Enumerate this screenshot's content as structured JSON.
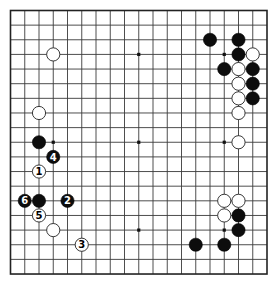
{
  "board": {
    "size": 19,
    "origin_x": 10.5,
    "origin_y": 10.5,
    "step_x": 14.25,
    "step_y": 14.64,
    "stone_radius": 6.6,
    "colors": {
      "background": "#ffffff",
      "line": "#3a3a3a",
      "black_stone": "#0d0d0d",
      "white_stone": "#ffffff"
    },
    "star_points": [
      [
        3,
        3
      ],
      [
        9,
        3
      ],
      [
        15,
        3
      ],
      [
        3,
        9
      ],
      [
        9,
        9
      ],
      [
        15,
        9
      ],
      [
        3,
        15
      ],
      [
        9,
        15
      ],
      [
        15,
        15
      ]
    ]
  },
  "stones": [
    {
      "col": 3,
      "row": 3,
      "color": "white",
      "label": ""
    },
    {
      "col": 2,
      "row": 7,
      "color": "white",
      "label": ""
    },
    {
      "col": 2,
      "row": 9,
      "color": "black",
      "label": ""
    },
    {
      "col": 2,
      "row": 13,
      "color": "black",
      "label": ""
    },
    {
      "col": 3,
      "row": 15,
      "color": "white",
      "label": ""
    },
    {
      "col": 14,
      "row": 2,
      "color": "black",
      "label": ""
    },
    {
      "col": 16,
      "row": 2,
      "color": "black",
      "label": ""
    },
    {
      "col": 16,
      "row": 3,
      "color": "black",
      "label": ""
    },
    {
      "col": 17,
      "row": 3,
      "color": "white",
      "label": ""
    },
    {
      "col": 15,
      "row": 4,
      "color": "black",
      "label": ""
    },
    {
      "col": 16,
      "row": 4,
      "color": "white",
      "label": ""
    },
    {
      "col": 17,
      "row": 4,
      "color": "black",
      "label": ""
    },
    {
      "col": 16,
      "row": 5,
      "color": "white",
      "label": ""
    },
    {
      "col": 17,
      "row": 5,
      "color": "black",
      "label": ""
    },
    {
      "col": 16,
      "row": 6,
      "color": "white",
      "label": ""
    },
    {
      "col": 17,
      "row": 6,
      "color": "black",
      "label": ""
    },
    {
      "col": 16,
      "row": 7,
      "color": "white",
      "label": ""
    },
    {
      "col": 16,
      "row": 9,
      "color": "white",
      "label": ""
    },
    {
      "col": 15,
      "row": 13,
      "color": "white",
      "label": ""
    },
    {
      "col": 16,
      "row": 13,
      "color": "white",
      "label": ""
    },
    {
      "col": 15,
      "row": 14,
      "color": "white",
      "label": ""
    },
    {
      "col": 16,
      "row": 14,
      "color": "black",
      "label": ""
    },
    {
      "col": 16,
      "row": 15,
      "color": "black",
      "label": ""
    },
    {
      "col": 13,
      "row": 16,
      "color": "black",
      "label": ""
    },
    {
      "col": 15,
      "row": 16,
      "color": "black",
      "label": ""
    }
  ],
  "moves": [
    {
      "col": 2,
      "row": 11,
      "color": "white",
      "label": "1"
    },
    {
      "col": 4,
      "row": 13,
      "color": "black",
      "label": "2"
    },
    {
      "col": 5,
      "row": 16,
      "color": "white",
      "label": "3"
    },
    {
      "col": 3,
      "row": 10,
      "color": "black",
      "label": "4"
    },
    {
      "col": 2,
      "row": 14,
      "color": "white",
      "label": "5"
    },
    {
      "col": 1,
      "row": 13,
      "color": "black",
      "label": "6"
    }
  ]
}
